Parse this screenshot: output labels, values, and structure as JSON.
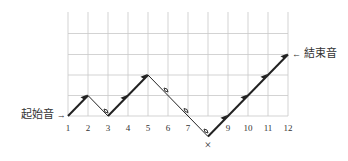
{
  "diagram": {
    "start_label": "起始音",
    "start_arrow": "→",
    "end_label": "結束音",
    "end_arrow": "←",
    "skip_mark": "×",
    "x_ticks": [
      "1",
      "2",
      "3",
      "4",
      "5",
      "6",
      "7",
      "",
      "9",
      "10",
      "11",
      "12"
    ],
    "path_levels": [
      0,
      1,
      0,
      1,
      2,
      1,
      0,
      -1,
      0,
      1,
      2,
      3
    ],
    "segment_types": [
      "up",
      "down",
      "up",
      "up",
      "down",
      "down",
      "down",
      "up",
      "up",
      "up",
      "up"
    ],
    "grid": {
      "columns": 12,
      "rows_above_base": 5
    },
    "colors": {
      "grid": "#c8c8c8",
      "line": "#222222",
      "text": "#333333"
    }
  }
}
